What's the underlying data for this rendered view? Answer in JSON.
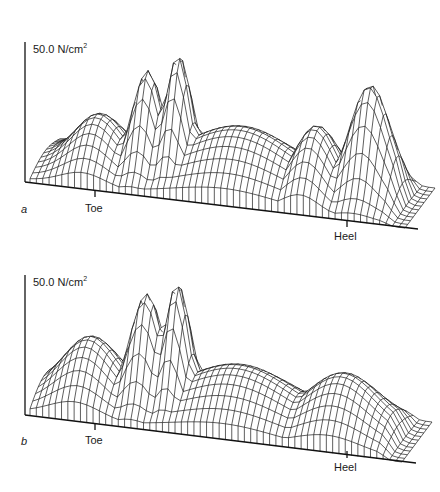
{
  "chart_data": [
    {
      "type": "surface-3d-wireframe",
      "panel": "a",
      "title": "",
      "scale_label": "50.0 N/cm²",
      "scale_value": 50.0,
      "scale_unit": "N/cm²",
      "axis_labels": [
        "Toe",
        "Heel"
      ],
      "description": "Plantar pressure distribution wireframe: sharp toe/forefoot peaks, lower midfoot plateau, tall rounded heel peak",
      "profile_along_foot": {
        "x_positions": [
          "toe-edge",
          "toe",
          "forefoot-1",
          "forefoot-peak",
          "forefoot-2",
          "midfoot",
          "midfoot-2",
          "heel-front",
          "heel-peak",
          "heel-back"
        ],
        "relative_height": [
          10,
          45,
          80,
          100,
          65,
          35,
          30,
          50,
          75,
          0
        ]
      }
    },
    {
      "type": "surface-3d-wireframe",
      "panel": "b",
      "title": "",
      "scale_label": "50.0 N/cm²",
      "scale_value": 50.0,
      "scale_unit": "N/cm²",
      "axis_labels": [
        "Toe",
        "Heel"
      ],
      "description": "Plantar pressure distribution wireframe: forefoot peaks, flatter midfoot, broad low heel plateau",
      "profile_along_foot": {
        "x_positions": [
          "toe-edge",
          "toe",
          "forefoot-1",
          "forefoot-peak",
          "forefoot-2",
          "midfoot",
          "midfoot-2",
          "heel-front",
          "heel-peak",
          "heel-back"
        ],
        "relative_height": [
          10,
          50,
          85,
          100,
          60,
          30,
          25,
          35,
          40,
          0
        ]
      }
    }
  ],
  "panels": {
    "a": {
      "letter": "a",
      "scale_label": "50.0 N/cm",
      "scale_sup": "2",
      "toe_label": "Toe",
      "heel_label": "Heel"
    },
    "b": {
      "letter": "b",
      "scale_label": "50.0 N/cm",
      "scale_sup": "2",
      "toe_label": "Toe",
      "heel_label": "Heel"
    }
  }
}
